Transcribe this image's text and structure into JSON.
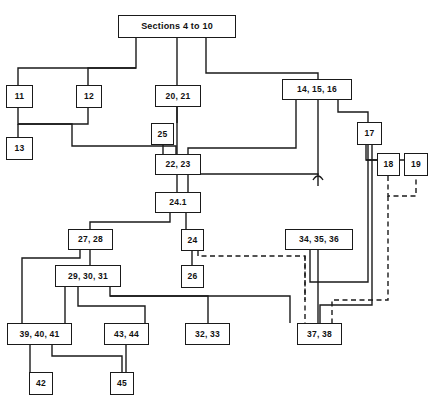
{
  "diagram": {
    "type": "flowchart",
    "title": "Sections 4 to 10",
    "width": 433,
    "height": 404,
    "line_color": "#1a1a1a",
    "background": "#ffffff",
    "nodes": [
      {
        "id": "root",
        "label": "Sections 4 to 10",
        "x": 118,
        "y": 15,
        "w": 118,
        "h": 23,
        "style": "big"
      },
      {
        "id": "n11",
        "label": "11",
        "x": 6,
        "y": 85,
        "w": 27,
        "h": 23,
        "style": "small"
      },
      {
        "id": "n12",
        "label": "12",
        "x": 76,
        "y": 85,
        "w": 26,
        "h": 23,
        "style": "small"
      },
      {
        "id": "n13",
        "label": "13",
        "x": 6,
        "y": 137,
        "w": 27,
        "h": 23,
        "style": "small"
      },
      {
        "id": "n2021",
        "label": "20, 21",
        "x": 155,
        "y": 85,
        "w": 46,
        "h": 22,
        "style": "small"
      },
      {
        "id": "n25",
        "label": "25",
        "x": 151,
        "y": 123,
        "w": 23,
        "h": 22,
        "style": "small"
      },
      {
        "id": "n2223",
        "label": "22, 23",
        "x": 155,
        "y": 154,
        "w": 46,
        "h": 21,
        "style": "small"
      },
      {
        "id": "n141516",
        "label": "14, 15, 16",
        "x": 282,
        "y": 79,
        "w": 70,
        "h": 21,
        "style": "small"
      },
      {
        "id": "n17",
        "label": "17",
        "x": 357,
        "y": 122,
        "w": 25,
        "h": 23,
        "style": "small"
      },
      {
        "id": "n18",
        "label": "18",
        "x": 377,
        "y": 153,
        "w": 23,
        "h": 23,
        "style": "small"
      },
      {
        "id": "n19",
        "label": "19",
        "x": 404,
        "y": 153,
        "w": 24,
        "h": 23,
        "style": "small"
      },
      {
        "id": "n241",
        "label": "24.1",
        "x": 155,
        "y": 192,
        "w": 46,
        "h": 21,
        "style": "small"
      },
      {
        "id": "n2728",
        "label": "27, 28",
        "x": 68,
        "y": 229,
        "w": 45,
        "h": 21,
        "style": "small"
      },
      {
        "id": "n24",
        "label": "24",
        "x": 181,
        "y": 229,
        "w": 23,
        "h": 22,
        "style": "small"
      },
      {
        "id": "n343536",
        "label": "34, 35, 36",
        "x": 285,
        "y": 229,
        "w": 68,
        "h": 21,
        "style": "small"
      },
      {
        "id": "n293031",
        "label": "29, 30, 31",
        "x": 55,
        "y": 265,
        "w": 66,
        "h": 22,
        "style": "small"
      },
      {
        "id": "n26",
        "label": "26",
        "x": 181,
        "y": 265,
        "w": 23,
        "h": 23,
        "style": "small"
      },
      {
        "id": "n394041",
        "label": "39, 40, 41",
        "x": 7,
        "y": 323,
        "w": 65,
        "h": 22,
        "style": "small"
      },
      {
        "id": "n4344",
        "label": "43, 44",
        "x": 104,
        "y": 323,
        "w": 45,
        "h": 22,
        "style": "small"
      },
      {
        "id": "n3233",
        "label": "32, 33",
        "x": 185,
        "y": 323,
        "w": 45,
        "h": 22,
        "style": "small"
      },
      {
        "id": "n3738",
        "label": "37, 38",
        "x": 297,
        "y": 323,
        "w": 45,
        "h": 22,
        "style": "small"
      },
      {
        "id": "n42",
        "label": "42",
        "x": 29,
        "y": 372,
        "w": 24,
        "h": 23,
        "style": "small"
      },
      {
        "id": "n45",
        "label": "45",
        "x": 110,
        "y": 372,
        "w": 24,
        "h": 23,
        "style": "small"
      }
    ],
    "solid_edges": [
      "M136,38 L136,68 L18,68 L18,85",
      "M136,68 L88,68 L88,85",
      "M177,38 L177,85",
      "M206,38 L206,73 L318,73 L318,79",
      "M18,108 L18,124 L72,124 L72,140 L72,146 L176,146 L176,154",
      "M18,124 L18,137",
      "M88,108 L88,124 L18,124",
      "M177,107 L177,123",
      "M163,145 L163,154",
      "M177,107 L177,154",
      "M296,100 L296,148 L188,148 L188,154",
      "M338,100 L338,112 L368,112 L368,122",
      "M318,100 L318,175",
      "M318,186 L318,174 L188,174 L188,192",
      "M177,175 L177,192",
      "M170,213 L170,222 L90,222 L90,229",
      "M186,213 L186,229",
      "M192,251 L192,265",
      "M80,250 L80,258 L22,258 L22,323",
      "M90,250 L90,265",
      "M366,145 L366,160 L388,160 L388,153",
      "M366,160 L416,160 L416,153",
      "M372,145 L372,305 L320,305 L320,323",
      "M318,250 L318,323",
      "M310,250 L310,282 L368,282 L368,145",
      "M65,287 L65,300 L65,323",
      "M78,287 L78,306 L145,306 L145,323",
      "M110,287 L110,296 L290,296 L290,323",
      "M110,296 L110,296 L208,296 L208,323",
      "M30,345 L30,372",
      "M52,345 L52,356 L122,356 L122,372",
      "M126,345 L126,372"
    ],
    "dashed_edges": [
      "M198,251 L198,256 L305,256 L305,330",
      "M388,176 L388,196 L416,196 L416,176",
      "M388,196 L388,300 L332,300 L332,323",
      "M305,256 L305,300"
    ],
    "line_hops": [
      {
        "x": 318,
        "y": 180
      }
    ]
  }
}
